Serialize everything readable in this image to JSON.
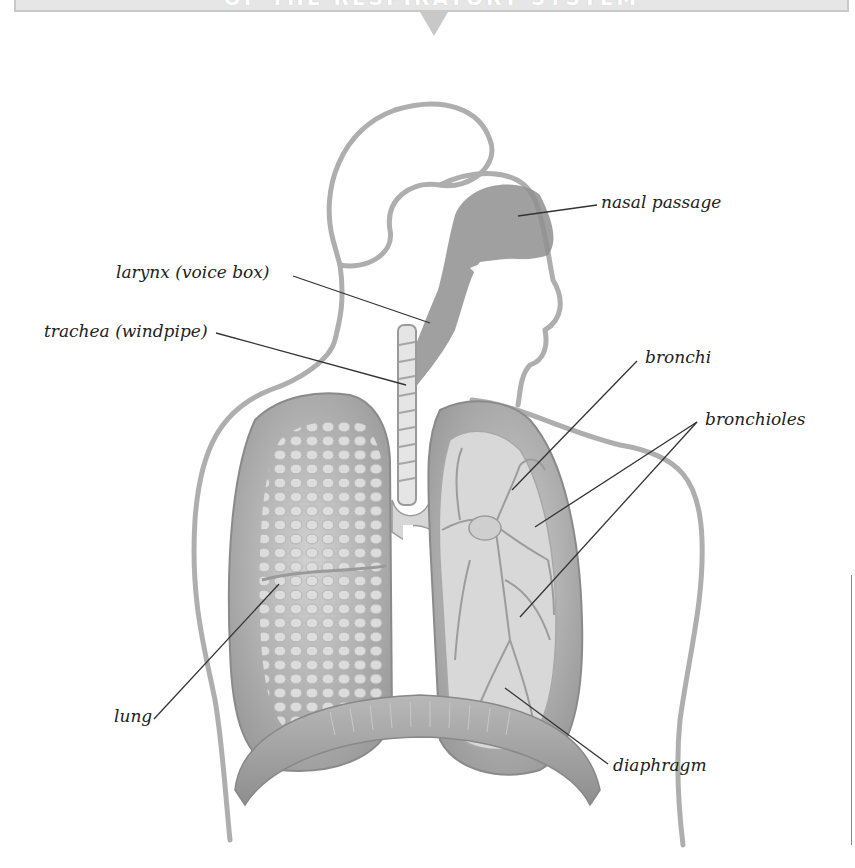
{
  "header": {
    "visible_fragment": "OF THE RESPIRATORY SYSTEM",
    "banner_color": "#e6e6e6",
    "border_color": "#c8c8c8"
  },
  "figure": {
    "colors": {
      "outline": "#9a9a9a",
      "lung_outer": "#a9a9a9",
      "lung_inner": "#cfcfcf",
      "airway": "#8f8f8f",
      "background": "#ffffff"
    }
  },
  "labels": [
    {
      "id": "nasal-passage",
      "text": "nasal passage"
    },
    {
      "id": "larynx",
      "text": "larynx (voice box)"
    },
    {
      "id": "trachea",
      "text": "trachea (windpipe)"
    },
    {
      "id": "bronchi",
      "text": "bronchi"
    },
    {
      "id": "bronchioles",
      "text": "bronchioles"
    },
    {
      "id": "lung",
      "text": "lung"
    },
    {
      "id": "diaphragm",
      "text": "diaphragm"
    }
  ]
}
